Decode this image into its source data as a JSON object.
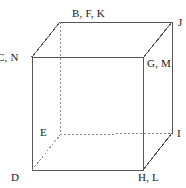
{
  "figure": {
    "type": "cube-net-labeled-diagram",
    "width": 186,
    "height": 188,
    "background_color": "#ffffff",
    "line_color": "#555555",
    "hidden_line_color": "#8c8c8c",
    "label_color": "#1a1a1a"
  },
  "labels": {
    "top_back_left": "B, F, K",
    "top_back_right": "J",
    "top_front_left": "C, N",
    "top_front_right": "G, M",
    "bottom_back_left": "E",
    "bottom_back_right": "I",
    "bottom_front_left": "D",
    "bottom_front_right": "H, L"
  },
  "geometry": {
    "front_face": {
      "top_left": [
        32,
        57
      ],
      "top_right": [
        143,
        58
      ],
      "bottom_right": [
        143,
        170
      ],
      "bottom_left": [
        32,
        170
      ]
    },
    "back_face": {
      "top_left": [
        60,
        22
      ],
      "top_right": [
        172,
        22
      ],
      "bottom_right": [
        172,
        133
      ],
      "bottom_left": [
        60,
        135
      ]
    },
    "solid_edges": [
      [
        [
          32,
          57
        ],
        [
          143,
          58
        ]
      ],
      [
        [
          143,
          58
        ],
        [
          143,
          170
        ]
      ],
      [
        [
          143,
          170
        ],
        [
          32,
          170
        ]
      ],
      [
        [
          32,
          170
        ],
        [
          32,
          57
        ]
      ],
      [
        [
          60,
          22
        ],
        [
          172,
          22
        ]
      ],
      [
        [
          172,
          22
        ],
        [
          172,
          133
        ]
      ],
      [
        [
          32,
          57
        ],
        [
          60,
          22
        ]
      ],
      [
        [
          143,
          58
        ],
        [
          172,
          22
        ]
      ],
      [
        [
          143,
          170
        ],
        [
          172,
          133
        ]
      ]
    ],
    "hidden_edges": [
      [
        [
          60,
          22
        ],
        [
          60,
          135
        ]
      ],
      [
        [
          60,
          135
        ],
        [
          172,
          133
        ]
      ],
      [
        [
          32,
          170
        ],
        [
          60,
          135
        ]
      ]
    ]
  }
}
